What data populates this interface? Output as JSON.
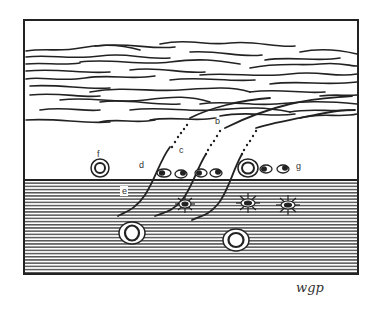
{
  "figure": {
    "type": "histology-schematic",
    "frame_color": "#222222",
    "line_color": "#222222",
    "labels": [
      {
        "id": "b",
        "text": "b",
        "x": 215,
        "y": 124
      },
      {
        "id": "c",
        "text": "c",
        "x": 179,
        "y": 153
      },
      {
        "id": "d",
        "text": "d",
        "x": 139,
        "y": 168
      },
      {
        "id": "e",
        "text": "e",
        "x": 122,
        "y": 194
      },
      {
        "id": "f",
        "text": "f",
        "x": 97,
        "y": 157
      },
      {
        "id": "g",
        "text": "g",
        "x": 296,
        "y": 169
      }
    ],
    "signature": "wgp"
  }
}
